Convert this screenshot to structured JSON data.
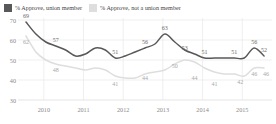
{
  "legend": {
    "items": [
      {
        "label": "% Approve, union member",
        "color": "#58585a",
        "icon": "legend-swatch-dark"
      },
      {
        "label": "% Approve, not a union member",
        "color": "#dededf",
        "icon": "legend-swatch-light"
      }
    ]
  },
  "chart_data": {
    "type": "line",
    "title": "",
    "xlabel": "",
    "ylabel": "",
    "ylim": [
      30,
      70
    ],
    "yticks": [
      30,
      40,
      50,
      60,
      70
    ],
    "xticks": [
      "2010",
      "2011",
      "2012",
      "2013",
      "2014",
      "2015"
    ],
    "grid": true,
    "legend_position": "top-left",
    "x": [
      2009.55,
      2009.8,
      2010.05,
      2010.3,
      2010.55,
      2010.8,
      2011.05,
      2011.3,
      2011.55,
      2011.8,
      2012.05,
      2012.3,
      2012.55,
      2012.8,
      2013.05,
      2013.3,
      2013.55,
      2013.8,
      2014.05,
      2014.3,
      2014.55,
      2014.8,
      2015.05,
      2015.3,
      2015.55
    ],
    "series": [
      {
        "name": "% Approve, union member",
        "color": "#58585a",
        "values": [
          69,
          63,
          59,
          57,
          55,
          52,
          53,
          56,
          55,
          51,
          52,
          54,
          56,
          58,
          63,
          59,
          55,
          53,
          51,
          51,
          51,
          51,
          51,
          56,
          52
        ],
        "labels": [
          {
            "x": 2009.55,
            "value": 69
          },
          {
            "x": 2010.3,
            "value": 57
          },
          {
            "x": 2011.8,
            "value": 51
          },
          {
            "x": 2012.55,
            "value": 56
          },
          {
            "x": 2013.05,
            "value": 63
          },
          {
            "x": 2013.55,
            "value": 53
          },
          {
            "x": 2014.05,
            "value": 51
          },
          {
            "x": 2014.8,
            "value": 51
          },
          {
            "x": 2015.3,
            "value": 56
          },
          {
            "x": 2015.55,
            "value": 52
          }
        ]
      },
      {
        "name": "% Approve, not a union member",
        "color": "#dededf",
        "values": [
          62,
          54,
          50,
          48,
          47,
          46,
          45,
          46,
          45,
          42,
          41,
          41,
          43,
          44,
          45,
          48,
          50,
          49,
          46,
          44,
          43,
          43,
          42,
          46,
          46
        ],
        "labels": [
          {
            "x": 2009.55,
            "value": 62
          },
          {
            "x": 2010.3,
            "value": 48
          },
          {
            "x": 2011.8,
            "value": 41
          },
          {
            "x": 2012.55,
            "value": 44
          },
          {
            "x": 2013.3,
            "value": 50
          },
          {
            "x": 2013.8,
            "value": 44
          },
          {
            "x": 2014.3,
            "value": 41
          },
          {
            "x": 2014.95,
            "value": 42
          },
          {
            "x": 2015.3,
            "value": 46
          },
          {
            "x": 2015.6,
            "value": 46
          }
        ]
      }
    ]
  },
  "axis_colors": {
    "grid": "#e8e8e8",
    "tick_text": "#8a8a8c",
    "baseline": "#d8d8d8"
  }
}
